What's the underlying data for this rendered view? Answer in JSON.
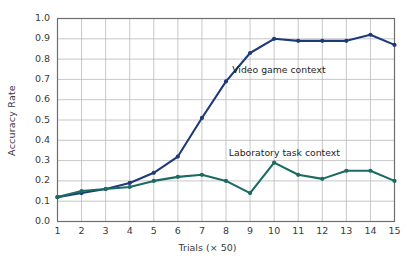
{
  "chart_data": {
    "type": "line",
    "title": "",
    "xlabel": "Trials (× 50)",
    "ylabel": "Accuracy Rate",
    "x": [
      1,
      2,
      3,
      4,
      5,
      6,
      7,
      8,
      9,
      10,
      11,
      12,
      13,
      14,
      15
    ],
    "xtick_labels": [
      "1",
      "2",
      "3",
      "4",
      "5",
      "6",
      "7",
      "8",
      "9",
      "10",
      "11",
      "12",
      "13",
      "14",
      "15"
    ],
    "ytick_labels": [
      "0.0",
      "0.1",
      "0.2",
      "0.3",
      "0.4",
      "0.5",
      "0.6",
      "0.7",
      "0.8",
      "0.9",
      "1.0"
    ],
    "ytick_values": [
      0.0,
      0.1,
      0.2,
      0.3,
      0.4,
      0.5,
      0.6,
      0.7,
      0.8,
      0.9,
      1.0
    ],
    "xlim": [
      1,
      15
    ],
    "ylim": [
      0.0,
      1.0
    ],
    "grid": true,
    "legend_position": "inline-annotations",
    "series": [
      {
        "name": "Video game context",
        "color": "#1f3a7a",
        "values": [
          0.12,
          0.14,
          0.16,
          0.19,
          0.24,
          0.32,
          0.51,
          0.69,
          0.83,
          0.9,
          0.89,
          0.89,
          0.89,
          0.92,
          0.87
        ],
        "annotation": "Video game context"
      },
      {
        "name": "Laboratory task context",
        "color": "#1a6b63",
        "values": [
          0.12,
          0.15,
          0.16,
          0.17,
          0.2,
          0.22,
          0.23,
          0.2,
          0.14,
          0.29,
          0.23,
          0.21,
          0.25,
          0.25,
          0.2
        ],
        "annotation": "Laboratory task context"
      }
    ],
    "annotations": [
      {
        "text": "Video game context",
        "x": 10.2,
        "y": 0.745
      },
      {
        "text": "Laboratory task context",
        "x": 10.6,
        "y": 0.335
      }
    ]
  }
}
